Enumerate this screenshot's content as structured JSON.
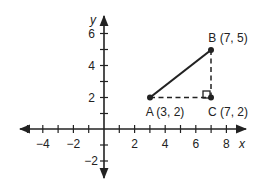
{
  "diagram": {
    "type": "coordinate-plane",
    "axes": {
      "x_label": "x",
      "y_label": "y",
      "x_ticks": [
        -5,
        -4,
        -3,
        -2,
        -1,
        1,
        2,
        3,
        4,
        5,
        6,
        7,
        8
      ],
      "y_ticks": [
        -2,
        -1,
        1,
        2,
        3,
        4,
        5,
        6
      ],
      "x_tick_labels": [
        "−4",
        "−2",
        "2",
        "4",
        "6",
        "8"
      ],
      "y_tick_labels": [
        "6",
        "4",
        "2",
        "−2"
      ],
      "x_range": [
        -5.5,
        9
      ],
      "y_range": [
        -3,
        7
      ]
    },
    "points": {
      "A": {
        "label": "A (3, 2)",
        "x": 3,
        "y": 2
      },
      "B": {
        "label": "B (7, 5)",
        "x": 7,
        "y": 5
      },
      "C": {
        "label": "C (7, 2)",
        "x": 7,
        "y": 2
      }
    },
    "segments": [
      {
        "from": "A",
        "to": "B",
        "style": "solid"
      },
      {
        "from": "A",
        "to": "C",
        "style": "dashed"
      },
      {
        "from": "B",
        "to": "C",
        "style": "dashed"
      }
    ],
    "right_angle_at": "C",
    "colors": {
      "ink": "#222222",
      "background": "#ffffff"
    }
  }
}
